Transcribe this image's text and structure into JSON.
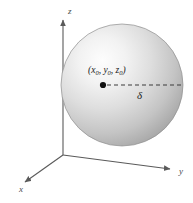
{
  "figure": {
    "background_color": "#ffffff"
  },
  "axes": {
    "origin": {
      "x": 63,
      "y": 155
    },
    "z_axis": {
      "label": "z",
      "label_x": 68,
      "label_y": 14,
      "from_x": 63,
      "from_y": 155,
      "to_x": 63,
      "to_y": 18,
      "color": "#5a5a5a"
    },
    "y_axis": {
      "label": "y",
      "label_x": 179,
      "label_y": 174,
      "from_x": 63,
      "from_y": 155,
      "to_x": 172,
      "to_y": 169,
      "color": "#5a5a5a"
    },
    "x_axis": {
      "label": "x",
      "label_x": 20,
      "label_y": 191,
      "from_x": 63,
      "from_y": 155,
      "to_x": 23,
      "to_y": 183,
      "color": "#5a5a5a"
    }
  },
  "sphere": {
    "center_x": 122,
    "center_y": 85,
    "radius": 61,
    "highlight_x": 92,
    "highlight_y": 68,
    "fill_light": "#fbfbfb",
    "fill_mid": "#d2d2d2",
    "fill_dark": "#8e8e8e",
    "edge_color": "#8a8a8a"
  },
  "center_point": {
    "name": "sphere-center-dot",
    "x": 103,
    "y": 85,
    "radius": 3,
    "color": "#111111"
  },
  "center_label": {
    "full": "(x0, y0, z0)",
    "open_paren": "(",
    "var_x": "x",
    "sub_x": "0",
    "comma_1": ", ",
    "var_y": "y",
    "sub_y": "0",
    "comma_2": ", ",
    "var_z": "z",
    "sub_z": "0",
    "close_paren": ")",
    "x": 88,
    "y": 73
  },
  "radius_line": {
    "name": "radius-dashed-line",
    "from_x": 107,
    "from_y": 85,
    "to_x": 181,
    "to_y": 85,
    "dash_pattern": "4,3",
    "color": "#3a3a3a"
  },
  "radius_label": {
    "symbol": "δ",
    "x": 137,
    "y": 99
  },
  "caption": {
    "text": "",
    "visible": false
  }
}
